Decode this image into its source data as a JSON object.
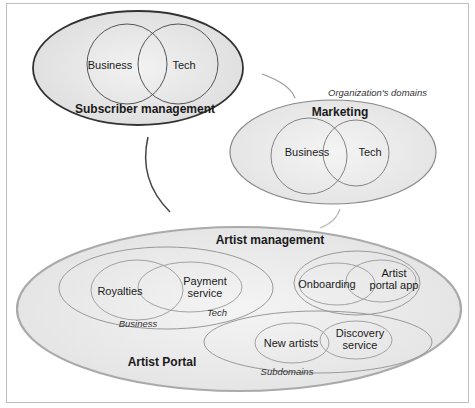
{
  "diagram": {
    "caption": "Organization's domains",
    "subdomains_caption": "Subdomains",
    "domains": {
      "subscriber": {
        "title": "Subscriber management",
        "left": "Business",
        "right": "Tech"
      },
      "marketing": {
        "title": "Marketing",
        "left": "Business",
        "right": "Tech"
      },
      "artist": {
        "title": "Artist management",
        "portal_label": "Artist Portal",
        "groups": [
          {
            "left": "Royalties",
            "right_line1": "Payment",
            "right_line2": "service",
            "business_tag": "Business",
            "tech_tag": "Tech"
          },
          {
            "left": "Onboarding",
            "right_line1": "Artist",
            "right_line2": "portal app"
          },
          {
            "left": "New artists",
            "right_line1": "Discovery",
            "right_line2": "service"
          }
        ]
      }
    }
  }
}
